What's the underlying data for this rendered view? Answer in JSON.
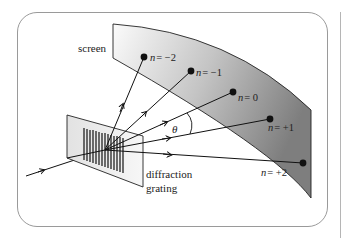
{
  "figure": {
    "labels": {
      "screen": "screen",
      "grating_line1": "diffraction",
      "grating_line2": "grating",
      "angle": "θ"
    },
    "orders": [
      {
        "label": "n = −2",
        "n": "n",
        "value": "= −2"
      },
      {
        "label": "n = −1",
        "n": "n",
        "value": "= −1"
      },
      {
        "label": "n = 0",
        "n": "n",
        "value": "= 0"
      },
      {
        "label": "n = +1",
        "n": "n",
        "value": "= +1"
      },
      {
        "label": "n = +2",
        "n": "n",
        "value": "= +2"
      }
    ],
    "colors": {
      "screen_dark": "#8c8c8c",
      "screen_light": "#f4f4f4",
      "frame_border": "#9a9a9a",
      "ink": "#111111"
    }
  }
}
